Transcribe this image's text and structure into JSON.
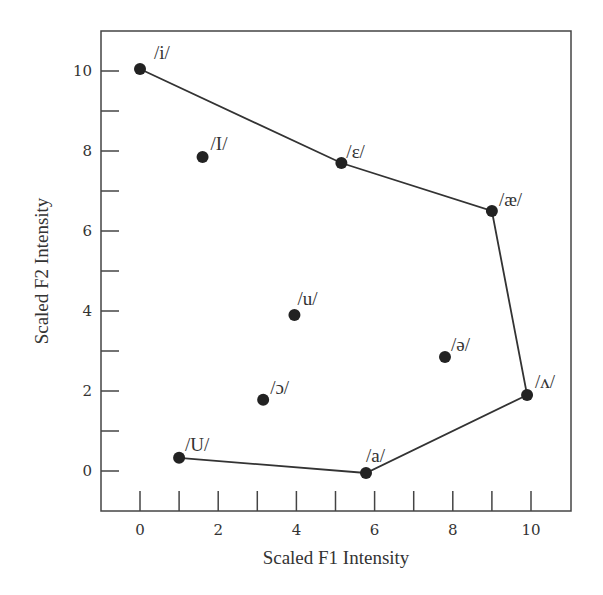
{
  "chart_data": {
    "type": "scatter",
    "title": "",
    "xlabel": "Scaled F1 Intensity",
    "ylabel": "Scaled F2 Intensity",
    "xlim": [
      -1,
      11
    ],
    "ylim": [
      -1,
      11
    ],
    "grid": false,
    "legend": null,
    "x_ticks": [
      0,
      2,
      4,
      6,
      8,
      10
    ],
    "x_minor_ticks": [
      0,
      1,
      2,
      3,
      4,
      5,
      6,
      7,
      8,
      9,
      10
    ],
    "y_ticks": [
      0,
      2,
      4,
      6,
      8,
      10
    ],
    "y_minor_ticks": [
      0,
      1,
      2,
      3,
      4,
      5,
      6,
      7,
      8,
      9,
      10
    ],
    "points": [
      {
        "label": "/i/",
        "x": 0.0,
        "y": 10.05
      },
      {
        "label": "/I/",
        "x": 1.6,
        "y": 7.85
      },
      {
        "label": "/ɛ/",
        "x": 5.15,
        "y": 7.7
      },
      {
        "label": "/æ/",
        "x": 9.0,
        "y": 6.5
      },
      {
        "label": "/u/",
        "x": 3.95,
        "y": 3.9
      },
      {
        "label": "/ə/",
        "x": 7.8,
        "y": 2.85
      },
      {
        "label": "/ʌ/",
        "x": 9.9,
        "y": 1.9
      },
      {
        "label": "/ɔ/",
        "x": 3.15,
        "y": 1.78
      },
      {
        "label": "/U/",
        "x": 1.0,
        "y": 0.33
      },
      {
        "label": "/a/",
        "x": 5.78,
        "y": -0.05
      }
    ],
    "outline_path": [
      "/i/",
      "/ɛ/",
      "/æ/",
      "/ʌ/",
      "/a/",
      "/U/"
    ],
    "colors": {
      "point": "#222222",
      "line": "#333333",
      "axis": "#444444"
    }
  }
}
